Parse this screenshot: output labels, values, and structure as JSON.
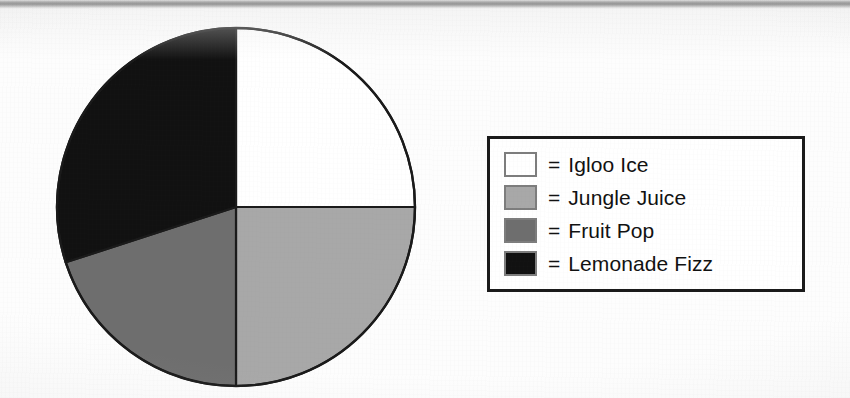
{
  "chart_data": {
    "type": "pie",
    "title": "",
    "categories": [
      "Igloo Ice",
      "Jungle Juice",
      "Fruit Pop",
      "Lemonade Fizz"
    ],
    "values": [
      25,
      25,
      20,
      30
    ],
    "unit": "percent",
    "total": 100,
    "legend_position": "right",
    "grid": false,
    "start_angle_deg": 0,
    "direction": "clockwise",
    "slices": [
      {
        "label": "Igloo Ice",
        "value": 25,
        "color": "#ffffff",
        "start_deg": 0,
        "end_deg": 90
      },
      {
        "label": "Jungle Juice",
        "value": 25,
        "color": "#a8a8a8",
        "start_deg": 90,
        "end_deg": 180
      },
      {
        "label": "Fruit Pop",
        "value": 20,
        "color": "#6e6e6e",
        "start_deg": 180,
        "end_deg": 252
      },
      {
        "label": "Lemonade Fizz",
        "value": 30,
        "color": "#111111",
        "start_deg": 252,
        "end_deg": 360
      }
    ]
  },
  "legend": {
    "equals_symbol": "=",
    "border_color": "#1a1a1a",
    "items": [
      {
        "label": "Igloo Ice",
        "color": "#ffffff",
        "swatch_name": "legend-swatch-igloo-ice"
      },
      {
        "label": "Jungle Juice",
        "color": "#a8a8a8",
        "swatch_name": "legend-swatch-jungle-juice"
      },
      {
        "label": "Fruit Pop",
        "color": "#6e6e6e",
        "swatch_name": "legend-swatch-fruit-pop"
      },
      {
        "label": "Lemonade Fizz",
        "color": "#111111",
        "swatch_name": "legend-swatch-lemonade-fizz"
      }
    ]
  },
  "pie": {
    "outline_color": "#1a1a1a",
    "center_x": 181,
    "center_y": 181,
    "radius": 179
  }
}
